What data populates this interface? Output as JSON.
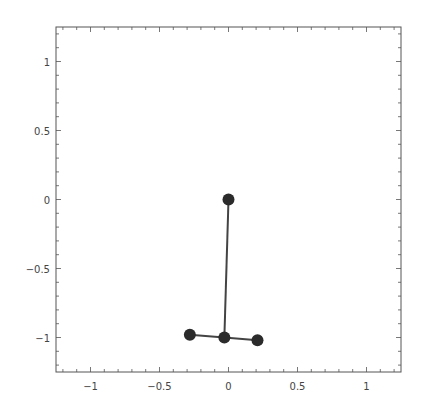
{
  "chart_data": {
    "type": "line",
    "title": "",
    "xlabel": "",
    "ylabel": "",
    "xlim": [
      -1.25,
      1.25
    ],
    "ylim": [
      -1.25,
      1.25
    ],
    "grid": false,
    "legend": null,
    "x_ticks": [
      -1,
      -0.5,
      0,
      0.5,
      1
    ],
    "x_tick_labels": [
      "−1",
      "−0.5",
      "0",
      "0.5",
      "1"
    ],
    "y_ticks": [
      1,
      0.5,
      0,
      -0.5,
      -1
    ],
    "y_tick_labels": [
      "1",
      "0.5",
      "0",
      "−0.5",
      "−1"
    ],
    "points": [
      {
        "id": "top",
        "x": 0.0,
        "y": 0.0
      },
      {
        "id": "center",
        "x": -0.03,
        "y": -1.0
      },
      {
        "id": "left",
        "x": -0.28,
        "y": -0.98
      },
      {
        "id": "right",
        "x": 0.21,
        "y": -1.02
      }
    ],
    "segments": [
      {
        "from": "top",
        "to": "center"
      },
      {
        "from": "left",
        "to": "center"
      },
      {
        "from": "center",
        "to": "right"
      }
    ],
    "colors": {
      "frame": "#555555",
      "line": "#444444",
      "point": "#2b2b2b"
    }
  }
}
